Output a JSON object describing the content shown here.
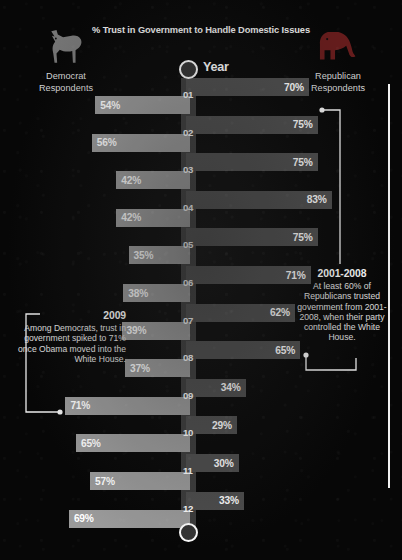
{
  "header": {
    "chart_title": "% Trust in Government to Handle Domestic Issues",
    "year_caption": "Year",
    "left_party": "Democrat\nRespondents",
    "left_party_line1": "Democrat",
    "left_party_line2": "Respondents",
    "right_party_line1": "Republican",
    "right_party_line2": "Respondents",
    "left_icon": "donkey-icon",
    "right_icon": "elephant-icon"
  },
  "colors": {
    "background": "#070707",
    "republican_bar": "#4d4d4d",
    "democrat_bar": "#9a9a9a",
    "axis_band": "#3c3c3c",
    "rule": "#f2f2f2",
    "text": "#ffffff"
  },
  "callouts": {
    "left": {
      "title": "2009",
      "body": "Among Democrats, trust in government spiked to 71% once Obama moved into the White House."
    },
    "right": {
      "title": "2001-2008",
      "body": "At least 60% of Republicans trusted government from 2001-2008, when their party controlled the White House."
    }
  },
  "chart_data": {
    "type": "bar",
    "title": "% Trust in Government to Handle Domestic Issues",
    "xlabel": "",
    "ylabel": "Year",
    "orientation": "horizontal-diverging",
    "categories": [
      "01",
      "02",
      "03",
      "04",
      "05",
      "06",
      "07",
      "08",
      "09",
      "10",
      "11",
      "12"
    ],
    "category_labels": [
      "01",
      "02",
      "03",
      "04",
      "05",
      "06",
      "07",
      "08",
      "09",
      "10",
      "11",
      "12"
    ],
    "value_suffix": "%",
    "xlim": [
      0,
      100
    ],
    "grid": false,
    "legend_position": "sides",
    "series": [
      {
        "name": "Republican Respondents",
        "side": "right",
        "color": "#4d4d4d",
        "values": [
          70,
          75,
          75,
          83,
          75,
          71,
          62,
          65,
          34,
          29,
          30,
          33
        ],
        "labels": [
          "70%",
          "75%",
          "75%",
          "83%",
          "75%",
          "71%",
          "62%",
          "65%",
          "34%",
          "29%",
          "30%",
          "33%"
        ]
      },
      {
        "name": "Democrat Respondents",
        "side": "left",
        "color": "#9a9a9a",
        "values": [
          54,
          56,
          42,
          42,
          35,
          38,
          39,
          37,
          71,
          65,
          57,
          69
        ],
        "labels": [
          "54%",
          "56%",
          "42%",
          "42%",
          "35%",
          "38%",
          "39%",
          "37%",
          "71%",
          "65%",
          "57%",
          "69%"
        ]
      }
    ],
    "annotations": [
      {
        "title": "2009",
        "text": "Among Democrats, trust in government spiked to 71% once Obama moved into the White House.",
        "points_to": {
          "series": "Democrat Respondents",
          "category": "09",
          "value": 71
        }
      },
      {
        "title": "2001-2008",
        "text": "At least 60% of Republicans trusted government from 2001-2008, when their party controlled the White House.",
        "points_to": {
          "series": "Republican Respondents",
          "categories": [
            "01",
            "02",
            "03",
            "04",
            "05",
            "06",
            "07",
            "08"
          ]
        }
      }
    ]
  }
}
